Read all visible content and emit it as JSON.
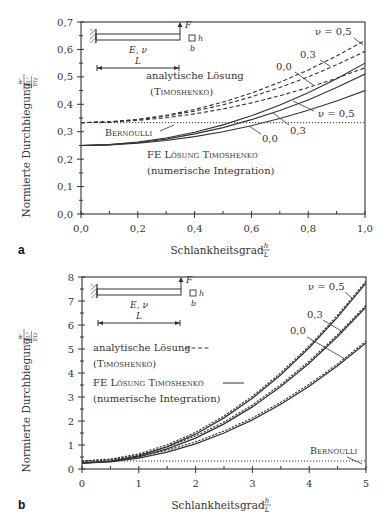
{
  "chart_data": [
    {
      "panel": "a",
      "type": "line",
      "title": "",
      "xlabel": "Schlankheitsgrad h/L",
      "ylabel": "Normierte Durchbiegung w_z(L)/(FL^3/EI_z)",
      "xlim": [
        0.0,
        1.0
      ],
      "ylim": [
        0.0,
        0.7
      ],
      "xticks": [
        "0,0",
        "0,2",
        "0,4",
        "0,6",
        "0,8",
        "1,0"
      ],
      "yticks": [
        "0,0",
        "0,1",
        "0,2",
        "0,3",
        "0,4",
        "0,5",
        "0,6",
        "0,7"
      ],
      "grid": false,
      "x": [
        0.0,
        0.1,
        0.2,
        0.3,
        0.4,
        0.5,
        0.6,
        0.7,
        0.8,
        0.9,
        1.0
      ],
      "series": [
        {
          "name": "analytische Lösung (Timoshenko) ν = 0,5",
          "style": "dashed",
          "values": [
            0.333,
            0.336,
            0.345,
            0.36,
            0.381,
            0.408,
            0.441,
            0.48,
            0.525,
            0.576,
            0.633
          ]
        },
        {
          "name": "analytische Lösung (Timoshenko) ν = 0,3",
          "style": "dashed",
          "values": [
            0.333,
            0.336,
            0.344,
            0.357,
            0.375,
            0.398,
            0.427,
            0.461,
            0.5,
            0.544,
            0.593
          ]
        },
        {
          "name": "analytische Lösung (Timoshenko) ν = 0,0",
          "style": "dashed",
          "values": [
            0.333,
            0.335,
            0.341,
            0.351,
            0.365,
            0.383,
            0.405,
            0.431,
            0.461,
            0.495,
            0.533
          ]
        },
        {
          "name": "FE Lösung Timoshenko ν = 0,5",
          "style": "solid",
          "values": [
            0.25,
            0.253,
            0.262,
            0.277,
            0.298,
            0.325,
            0.358,
            0.397,
            0.442,
            0.493,
            0.55
          ]
        },
        {
          "name": "FE Lösung Timoshenko ν = 0,3",
          "style": "solid",
          "values": [
            0.25,
            0.253,
            0.26,
            0.273,
            0.292,
            0.315,
            0.344,
            0.377,
            0.416,
            0.461,
            0.51
          ]
        },
        {
          "name": "FE Lösung Timoshenko ν = 0,0",
          "style": "solid",
          "values": [
            0.25,
            0.252,
            0.258,
            0.268,
            0.282,
            0.3,
            0.322,
            0.348,
            0.378,
            0.412,
            0.45
          ]
        },
        {
          "name": "Bernoulli",
          "style": "dotted",
          "values": [
            0.333,
            0.333,
            0.333,
            0.333,
            0.333,
            0.333,
            0.333,
            0.333,
            0.333,
            0.333,
            0.333
          ]
        }
      ],
      "annotations": [
        "ν = 0,5",
        "0,3",
        "0,0",
        "ν = 0,5",
        "0,3",
        "0,0",
        "Bernoulli",
        "analytische Lösung (Timoshenko)",
        "FE Lösung Timoshenko (numerische Integration)"
      ]
    },
    {
      "panel": "b",
      "type": "line",
      "title": "",
      "xlabel": "Schlankheitsgrad h/L",
      "ylabel": "Normierte Durchbiegung w_z(L)/(FL^3/EI_z)",
      "xlim": [
        0,
        5
      ],
      "ylim": [
        0,
        8
      ],
      "xticks": [
        "0",
        "1",
        "2",
        "3",
        "4",
        "5"
      ],
      "yticks": [
        "0",
        "1",
        "2",
        "3",
        "4",
        "5",
        "6",
        "7",
        "8"
      ],
      "grid": false,
      "x": [
        0,
        0.5,
        1,
        1.5,
        2,
        2.5,
        3,
        3.5,
        4,
        4.5,
        5
      ],
      "series": [
        {
          "name": "analytische Lösung (Timoshenko) ν = 0,5",
          "style": "dashed",
          "values": [
            0.33,
            0.41,
            0.63,
            1.01,
            1.53,
            2.21,
            3.03,
            4.01,
            5.13,
            6.41,
            7.83
          ]
        },
        {
          "name": "analytische Lösung (Timoshenko) ν = 0,3",
          "style": "dashed",
          "values": [
            0.33,
            0.4,
            0.59,
            0.92,
            1.37,
            1.96,
            2.67,
            3.52,
            4.49,
            5.6,
            6.83
          ]
        },
        {
          "name": "analytische Lösung (Timoshenko) ν = 0,0",
          "style": "dashed",
          "values": [
            0.33,
            0.38,
            0.53,
            0.78,
            1.13,
            1.58,
            2.13,
            2.78,
            3.53,
            4.38,
            5.33
          ]
        },
        {
          "name": "FE Lösung Timoshenko ν = 0,5",
          "style": "solid",
          "values": [
            0.25,
            0.33,
            0.55,
            0.93,
            1.45,
            2.13,
            2.95,
            3.93,
            5.05,
            6.33,
            7.75
          ]
        },
        {
          "name": "FE Lösung Timoshenko ν = 0,3",
          "style": "solid",
          "values": [
            0.25,
            0.32,
            0.51,
            0.84,
            1.29,
            1.88,
            2.59,
            3.44,
            4.41,
            5.52,
            6.75
          ]
        },
        {
          "name": "FE Lösung Timoshenko ν = 0,0",
          "style": "solid",
          "values": [
            0.25,
            0.3,
            0.45,
            0.7,
            1.05,
            1.5,
            2.05,
            2.7,
            3.45,
            4.3,
            5.25
          ]
        },
        {
          "name": "Bernoulli",
          "style": "dotted",
          "values": [
            0.333,
            0.333,
            0.333,
            0.333,
            0.333,
            0.333,
            0.333,
            0.333,
            0.333,
            0.333,
            0.333
          ]
        }
      ],
      "annotations": [
        "ν = 0,5",
        "0,3",
        "0,0",
        "Bernoulli",
        "analytische Lösung (Timoshenko)",
        "FE Lösung Timoshenko (numerische Integration)"
      ]
    }
  ],
  "labels": {
    "panel_a": "a",
    "panel_b": "b",
    "ylabel_text": "Normierte Durchbiegung",
    "xlabel_text": "Schlankheitsgrad",
    "frac_h": "h",
    "frac_L": "L",
    "analytic_line1": "analytische Lösung",
    "analytic_line2": "(Timoshenko)",
    "fe_line1": "FE Lösung Timoshenko",
    "fe_line2": "(numerische Integration)",
    "bernoulli": "Bernoulli",
    "nu_05": "ν = 0,5",
    "v_03": "0,3",
    "v_00": "0,0",
    "sketch_F": "F",
    "sketch_E_nu": "E, ν",
    "sketch_L": "L",
    "sketch_h": "h",
    "sketch_b": "b"
  },
  "colors": {
    "ink": "#333333",
    "axis": "#333333",
    "background": "#ffffff"
  }
}
